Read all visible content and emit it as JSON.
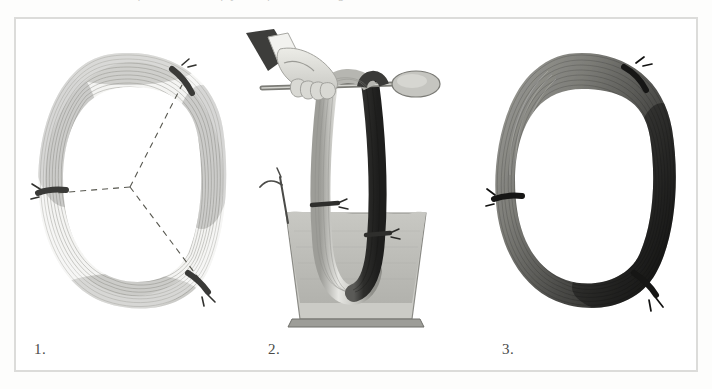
{
  "plate": {
    "top_bleed_text": "of the hank of yarn for shading",
    "border_color": "#dcdcda",
    "background_color": "#ffffff"
  },
  "figures": [
    {
      "number": "1.",
      "name": "undyed-hank-with-tie-marks",
      "description": "Undyed skein of yarn formed into a loop, bound at three points, with dashed construction lines converging at the centre",
      "tie_count": 3,
      "tie_positions": [
        "top-right",
        "left",
        "bottom-right"
      ],
      "yarn_tone": "#9a9a96",
      "yarn_tone_light": "#e9e9e6",
      "tie_color": "#3a3a38",
      "dash_color": "#55554f",
      "has_dashed_lines": true
    },
    {
      "number": "2.",
      "name": "hank-dipped-in-dye-vat",
      "description": "Hand holding a rod from which the hank hangs, lowered into a tapered dye vat filled with liquid",
      "vat_fill_color": "#bcbcb7",
      "vat_body_color": "#c6c6c1",
      "vat_rim_color": "#8a8a85",
      "sleeve_color": "#3d3d3b",
      "cuff_color": "#f2f2ef",
      "hand_color": "#d8d8d3",
      "rod_color": "#7c7c77",
      "yarn_light_tone": "#d2d2cd",
      "yarn_dark_tone": "#3c3c3a",
      "tie_color": "#2e2e2c",
      "tie_count": 2
    },
    {
      "number": "3.",
      "name": "shaded-dyed-hank",
      "description": "Finished skein showing graduated shading from light grey through to near black around the loop",
      "tie_count": 3,
      "tie_positions": [
        "top-right",
        "left",
        "bottom-right"
      ],
      "gradient_light": "#8d8d88",
      "gradient_mid": "#5a5a56",
      "gradient_dark": "#1c1c1b",
      "tie_color": "#161615"
    }
  ]
}
